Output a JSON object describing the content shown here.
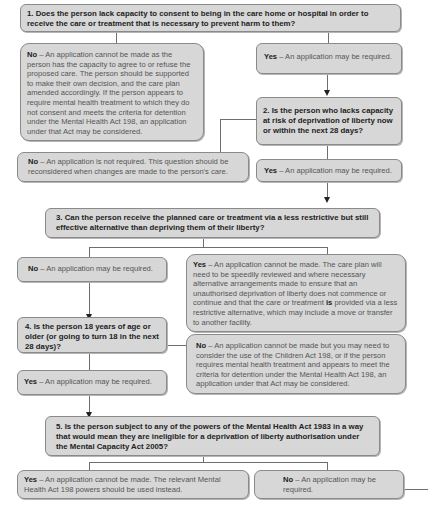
{
  "diagram": {
    "q1": {
      "text": "1. Does the person lack capacity to consent to being in the care home or hospital in order to receive the care or treatment that is necessary to prevent harm to them?",
      "no": {
        "label": "No",
        "text": " – An application cannot be made as the person has the capacity to agree to or refuse the proposed care. The person should be supported to make their own decision, and the care plan amended accordingly. If the person appears to require mental health treatment to which they do not consent and meets the criteria for detention under the Mental Health Act 198, an application under that Act may be considered."
      },
      "yes": {
        "label": "Yes",
        "text": " – An application may be required."
      }
    },
    "q2": {
      "text": "2. Is the person who lacks capacity at risk of deprivation of liberty now or within the next 28 days?",
      "no": {
        "label": "No",
        "text": " – An application is not required. This question should be reconsidered when changes are made to the person's care."
      },
      "yes": {
        "label": "Yes",
        "text": " – An application may be required."
      }
    },
    "q3": {
      "text": "3. Can the person receive the planned care or treatment via a less restrictive but still effective alternative than depriving them of their liberty?",
      "no": {
        "label": "No",
        "text": " – An application may be required."
      },
      "yes": {
        "label": "Yes",
        "text_a": " – An application cannot be made. The care plan will need to be speedily reviewed and where necessary alternative arrangements made to ensure that an unauthorised deprivation of liberty does not commence or continue and that the care or treatment ",
        "emph": "is",
        "text_b": " provided via a less restrictive alternative, which may include a move or transfer to another facility."
      }
    },
    "q4": {
      "text": "4. Is the person 18 years of age or older (or going to turn 18 in the next 28 days)?",
      "no": {
        "label": "No",
        "text": " – An application cannot be made but you may need to consider the use of the Children Act 198, or if the person requires mental health treatment and appears to meet the criteria for detention under the Mental Health Act 198, an application under that Act may be considered."
      },
      "yes": {
        "label": "Yes",
        "text": " – An application may be required."
      }
    },
    "q5": {
      "text": "5. Is the person subject to any of the powers of the Mental Health Act 1983 in a way that would mean they are ineligible for a deprivation of liberty authorisation under the Mental Capacity Act 2005?",
      "yes": {
        "label": "Yes",
        "text": " – An application cannot be made. The relevant Mental Health Act 198 powers should be used instead."
      },
      "no": {
        "label": "No",
        "text": " – An application may be required."
      }
    }
  }
}
